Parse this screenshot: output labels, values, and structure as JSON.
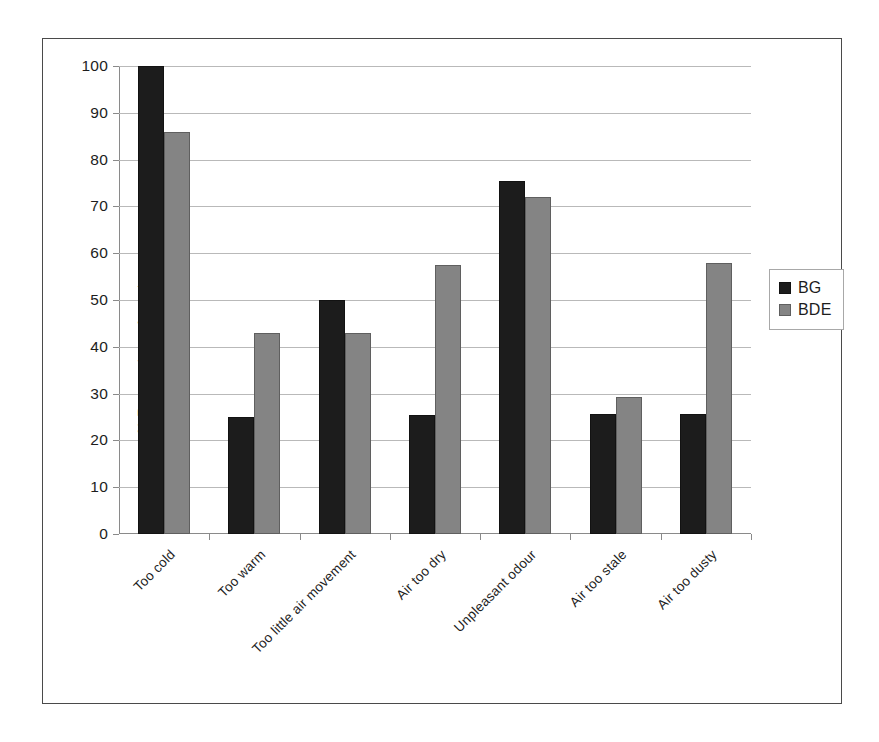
{
  "chart_data": {
    "type": "bar",
    "title": "",
    "xlabel": "",
    "ylabel": "% Respondents Agreeing",
    "ylim": [
      0,
      100
    ],
    "ytick_step": 10,
    "yticks": [
      100,
      90,
      80,
      70,
      60,
      50,
      40,
      30,
      20,
      10,
      0
    ],
    "grid": true,
    "legend_position": "right",
    "categories": [
      "Too cold",
      "Too warm",
      "Too little air movement",
      "Air too dry",
      "Unpleasant odour",
      "Air too stale",
      "Air too dusty"
    ],
    "series": [
      {
        "name": "BG",
        "color": "#1c1c1c",
        "values": [
          100,
          25,
          50,
          25.5,
          75.5,
          25.7,
          25.7
        ]
      },
      {
        "name": "BDE",
        "color": "#848484",
        "values": [
          86,
          43,
          43,
          57.5,
          72,
          29.3,
          58
        ]
      }
    ]
  },
  "legend": {
    "items": [
      {
        "label": "BG"
      },
      {
        "label": "BDE"
      }
    ]
  }
}
